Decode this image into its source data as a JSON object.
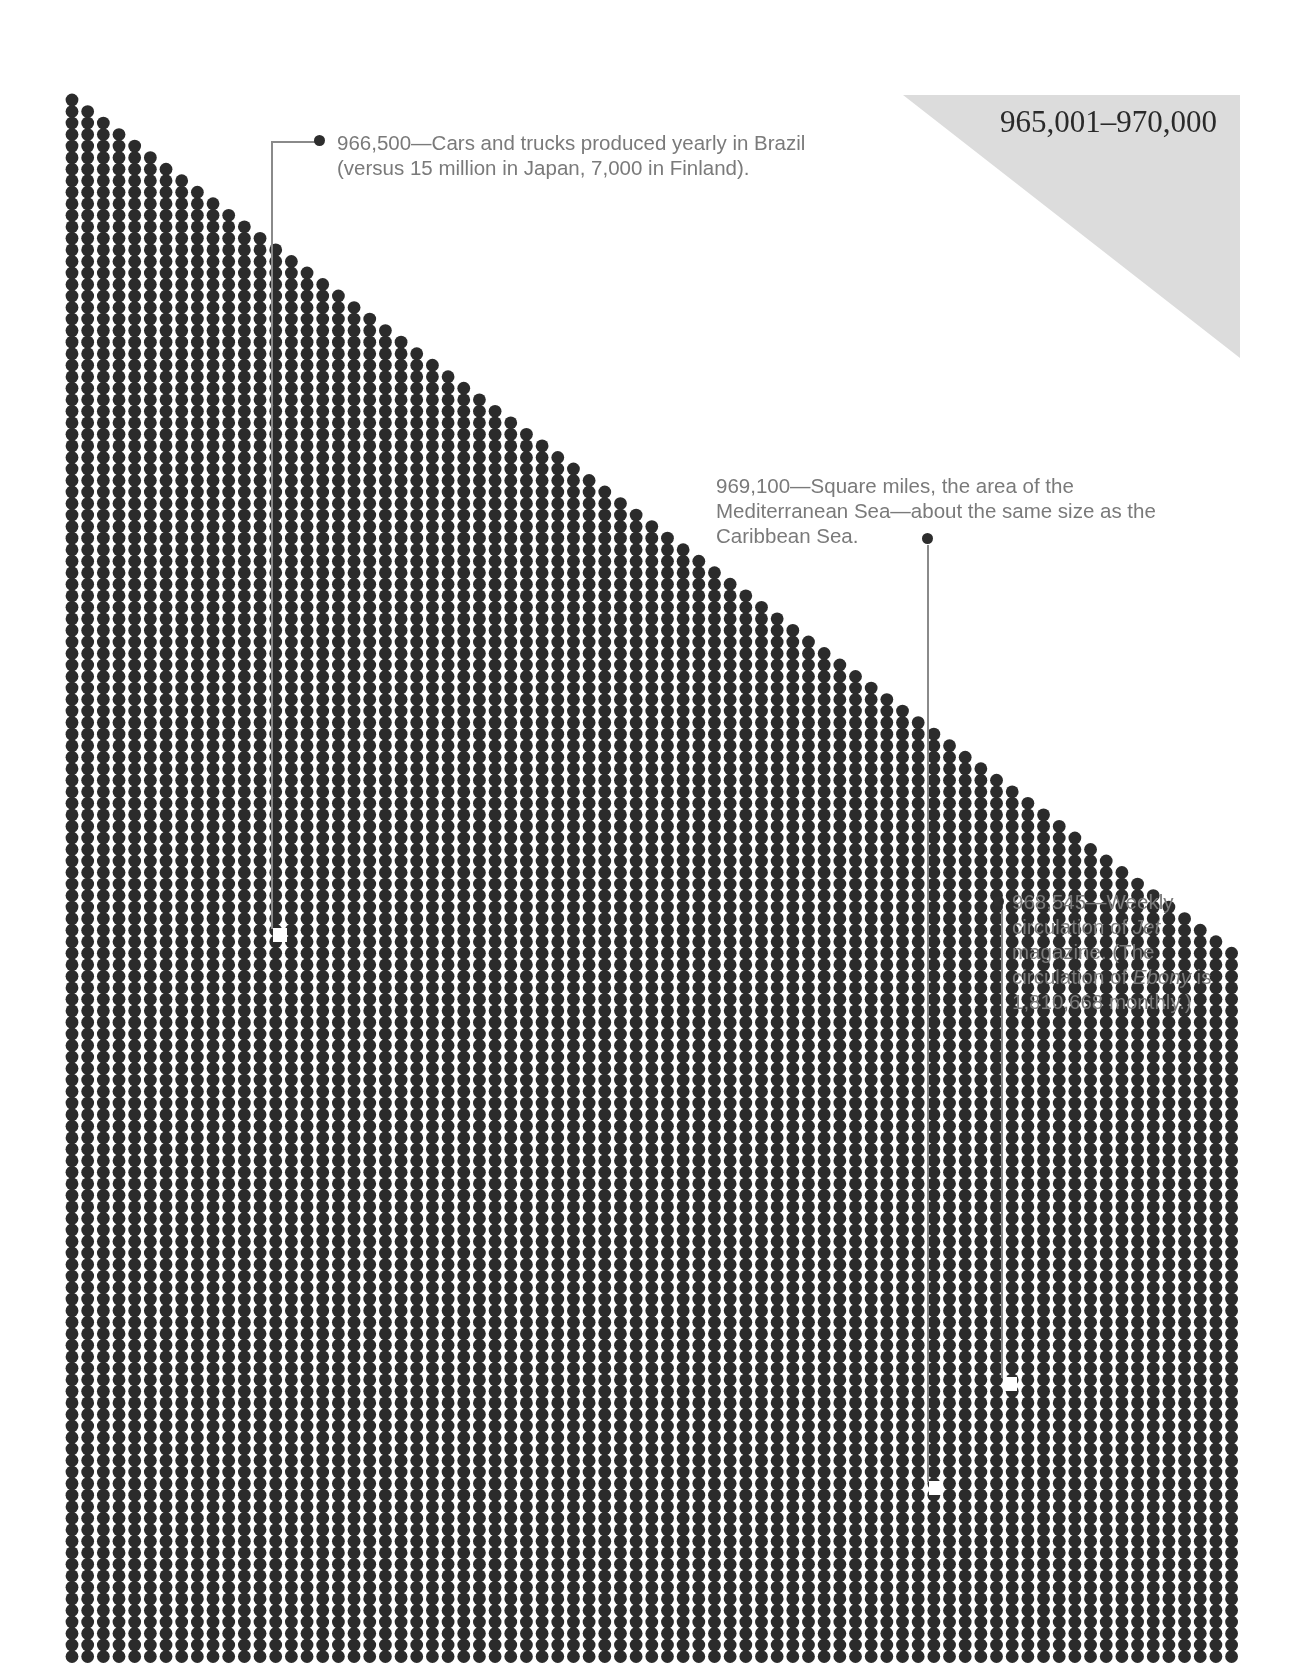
{
  "range": {
    "title": "965,001–970,000",
    "background_color": "#dcdcdc"
  },
  "grid": {
    "dot_color": "#2b2b2b",
    "start_number": 965001,
    "end_number": 970000,
    "shape": "descending staircase triangle of dots, one dot per number"
  },
  "annotations": [
    {
      "value": "966,500",
      "text_parts": [
        "966,500—Cars and trucks produced yearly in Brazil (versus 15 million in Japan, 7,000 in Finland)."
      ]
    },
    {
      "value": "969,100",
      "text_parts": [
        "969,100—Square miles, the area of the Mediterranean Sea—about the same size as the Caribbean Sea."
      ]
    },
    {
      "value": "968,545",
      "line1": "968,545—Weekly",
      "line2_pre": "circulation of ",
      "line2_em": "Jet",
      "line3": "magazine. (The",
      "line4_pre": "circulation of ",
      "line4_em": "Ebony",
      "line4_post": " is",
      "line5": "1,810,668 monthly.)"
    }
  ]
}
